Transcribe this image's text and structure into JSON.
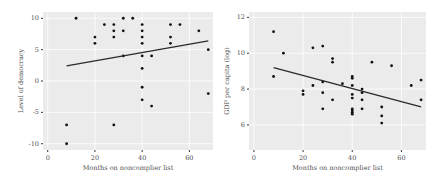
{
  "chart_data": [
    {
      "type": "scatter",
      "title": "",
      "xlabel": "Months on noncomplier list",
      "ylabel": "Level of democracy",
      "xlim": [
        -2,
        70
      ],
      "ylim": [
        -11,
        11
      ],
      "xticks": [
        0,
        20,
        40,
        60
      ],
      "yticks": [
        -10,
        -5,
        0,
        5,
        10
      ],
      "grid": true,
      "legend": null,
      "points": [
        [
          8,
          -10
        ],
        [
          8,
          -7
        ],
        [
          12,
          10
        ],
        [
          20,
          7
        ],
        [
          20,
          6
        ],
        [
          24,
          9
        ],
        [
          28,
          9
        ],
        [
          28,
          8
        ],
        [
          28,
          7
        ],
        [
          28,
          -7
        ],
        [
          32,
          10
        ],
        [
          32,
          8
        ],
        [
          32,
          4
        ],
        [
          36,
          10
        ],
        [
          40,
          9
        ],
        [
          40,
          8
        ],
        [
          40,
          7
        ],
        [
          40,
          6
        ],
        [
          40,
          4
        ],
        [
          40,
          2
        ],
        [
          40,
          -1
        ],
        [
          40,
          -3
        ],
        [
          44,
          4
        ],
        [
          44,
          -4
        ],
        [
          52,
          9
        ],
        [
          52,
          7
        ],
        [
          52,
          6
        ],
        [
          56,
          9
        ],
        [
          64,
          8
        ],
        [
          68,
          5
        ],
        [
          68,
          -2
        ]
      ],
      "fit_line": {
        "x": [
          8,
          68
        ],
        "y": [
          2.4,
          6.4
        ]
      }
    },
    {
      "type": "scatter",
      "title": "",
      "xlabel": "Months on noncomplier list",
      "ylabel": "GDP per capita (log)",
      "xlim": [
        -2,
        70
      ],
      "ylim": [
        4.6,
        12.3
      ],
      "xticks": [
        0,
        20,
        40,
        60
      ],
      "yticks": [
        6,
        8,
        10,
        12
      ],
      "grid": true,
      "legend": null,
      "points": [
        [
          8,
          11.2
        ],
        [
          8,
          8.7
        ],
        [
          12,
          10.0
        ],
        [
          20,
          7.9
        ],
        [
          20,
          7.7
        ],
        [
          24,
          10.3
        ],
        [
          24,
          8.2
        ],
        [
          28,
          10.4
        ],
        [
          28,
          8.4
        ],
        [
          28,
          7.8
        ],
        [
          28,
          6.9
        ],
        [
          32,
          9.7
        ],
        [
          32,
          9.5
        ],
        [
          32,
          7.4
        ],
        [
          36,
          8.3
        ],
        [
          40,
          8.7
        ],
        [
          40,
          8.6
        ],
        [
          40,
          8.2
        ],
        [
          40,
          7.7
        ],
        [
          40,
          7.5
        ],
        [
          40,
          6.9
        ],
        [
          40,
          6.8
        ],
        [
          40,
          6.7
        ],
        [
          40,
          6.6
        ],
        [
          44,
          8.0
        ],
        [
          44,
          7.8
        ],
        [
          44,
          7.4
        ],
        [
          44,
          6.9
        ],
        [
          48,
          9.5
        ],
        [
          52,
          7.0
        ],
        [
          52,
          6.5
        ],
        [
          52,
          6.1
        ],
        [
          56,
          9.3
        ],
        [
          64,
          8.2
        ],
        [
          68,
          8.5
        ],
        [
          68,
          7.4
        ]
      ],
      "fit_line": {
        "x": [
          8,
          68
        ],
        "y": [
          9.2,
          7.0
        ]
      }
    }
  ]
}
